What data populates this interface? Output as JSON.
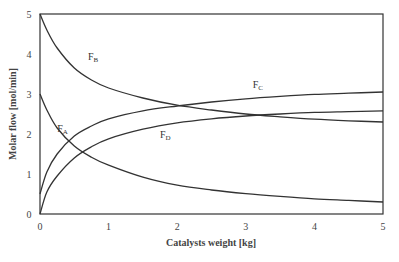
{
  "chart_data": {
    "type": "line",
    "title": "",
    "xlabel": "Catalysts weight [kg]",
    "ylabel": "Molar flow [mol/min]",
    "xlim": [
      0,
      5
    ],
    "ylim": [
      0,
      5
    ],
    "xticks": [
      "0",
      "1",
      "2",
      "3",
      "4",
      "5"
    ],
    "yticks": [
      "0",
      "1",
      "2",
      "3",
      "4",
      "5"
    ],
    "grid": false,
    "legend": "inline labels",
    "x": [
      0,
      0.1,
      0.25,
      0.5,
      0.75,
      1,
      1.5,
      2,
      2.5,
      3,
      3.5,
      4,
      4.5,
      5
    ],
    "series": [
      {
        "name": "F_A",
        "label_main": "F",
        "label_sub": "A",
        "label_pos": [
          0.25,
          2.05
        ],
        "values": [
          3.0,
          2.6,
          2.15,
          1.7,
          1.42,
          1.22,
          0.92,
          0.72,
          0.6,
          0.51,
          0.44,
          0.38,
          0.34,
          0.3
        ]
      },
      {
        "name": "F_B",
        "label_main": "F",
        "label_sub": "B",
        "label_pos": [
          0.7,
          3.85
        ],
        "values": [
          5.0,
          4.6,
          4.15,
          3.65,
          3.35,
          3.15,
          2.9,
          2.72,
          2.6,
          2.5,
          2.43,
          2.37,
          2.33,
          2.3
        ]
      },
      {
        "name": "F_C",
        "label_main": "F",
        "label_sub": "C",
        "label_pos": [
          3.1,
          3.15
        ],
        "values": [
          0.5,
          1.05,
          1.5,
          1.95,
          2.2,
          2.38,
          2.58,
          2.7,
          2.8,
          2.88,
          2.94,
          2.99,
          3.02,
          3.05
        ]
      },
      {
        "name": "F_D",
        "label_main": "F",
        "label_sub": "D",
        "label_pos": [
          1.75,
          1.9
        ],
        "values": [
          0.0,
          0.55,
          0.95,
          1.4,
          1.68,
          1.88,
          2.12,
          2.28,
          2.38,
          2.45,
          2.5,
          2.54,
          2.56,
          2.58
        ]
      }
    ]
  }
}
